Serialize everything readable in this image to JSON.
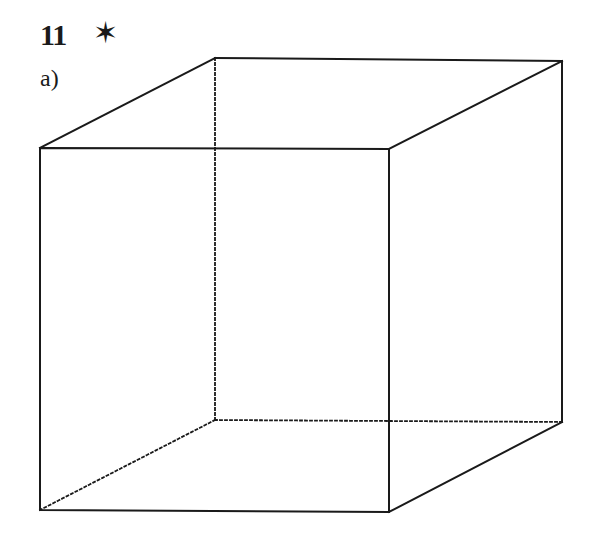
{
  "exercise": {
    "number": "11",
    "difficulty_marker": "✶",
    "part_label": "a)"
  },
  "figure": {
    "type": "cube",
    "projection": "oblique",
    "line_color": "#1a1a1a",
    "background": "#ffffff",
    "vertices": {
      "front_top_left": [
        40,
        148
      ],
      "front_top_right": [
        389,
        149
      ],
      "front_bottom_left": [
        40,
        510
      ],
      "front_bottom_right": [
        389,
        512
      ],
      "back_top_left": [
        215,
        58
      ],
      "back_top_right": [
        562,
        61
      ],
      "back_bottom_left": [
        215,
        420
      ],
      "back_bottom_right": [
        562,
        422
      ]
    },
    "visible_edges": 9,
    "hidden_edges_dotted": 3
  }
}
